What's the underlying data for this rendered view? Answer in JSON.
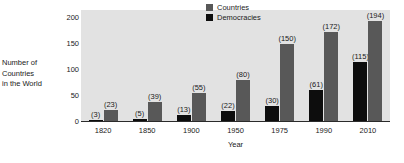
{
  "chart_data": {
    "type": "bar",
    "title": "",
    "subtitle": "",
    "xlabel": "Year",
    "ylabel": "Number of Countries in the World",
    "ylabel_lines": [
      "Number of",
      "Countries",
      "in the World"
    ],
    "categories": [
      "1820",
      "1850",
      "1900",
      "1950",
      "1975",
      "1990",
      "2010"
    ],
    "series": [
      {
        "name": "Democracies",
        "color": "#0d0d0d",
        "values": [
          3,
          5,
          13,
          22,
          30,
          61,
          115
        ],
        "value_labels": [
          "(3)",
          "(5)",
          "(13)",
          "(22)",
          "(30)",
          "(61)",
          "(115)"
        ]
      },
      {
        "name": "Countries",
        "color": "#585858",
        "values": [
          23,
          39,
          55,
          80,
          150,
          172,
          194
        ],
        "value_labels": [
          "(23)",
          "(39)",
          "(55)",
          "(80)",
          "(150)",
          "(172)",
          "(194)"
        ]
      }
    ],
    "ylim": [
      0,
      215
    ],
    "yticks": [
      0,
      50,
      100,
      150,
      200
    ],
    "ytick_labels": [
      "0",
      "50",
      "100",
      "150",
      "200"
    ],
    "grid": false,
    "legend_position": "top-center",
    "plot_background": "#e2e2e2",
    "legend_entries": [
      {
        "label": "Countries",
        "color": "#585858"
      },
      {
        "label": "Democracies",
        "color": "#0d0d0d"
      }
    ]
  }
}
